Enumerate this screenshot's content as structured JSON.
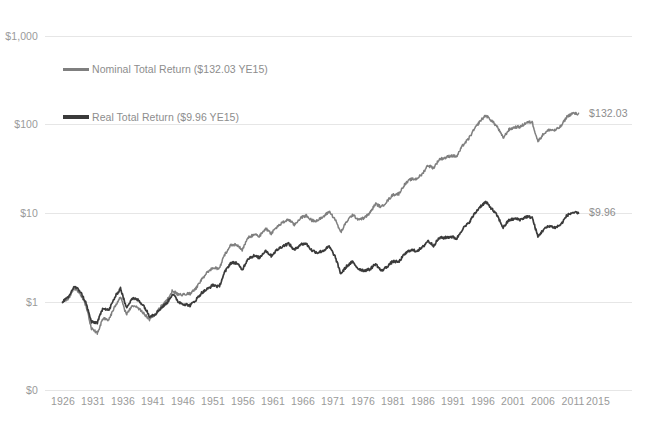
{
  "chart_data": {
    "type": "line",
    "title": "",
    "subtitle": "",
    "xlabel": "",
    "ylabel": "",
    "yscale": "log",
    "grid": true,
    "legend_position": "upper-left-inside",
    "y_ticks": [
      "$0",
      "$1",
      "$10",
      "$100",
      "$1,000"
    ],
    "y_tick_values": [
      0,
      1,
      10,
      100,
      1000
    ],
    "ylim": [
      0,
      1000
    ],
    "x_ticks": [
      "1926",
      "1931",
      "1936",
      "1941",
      "1946",
      "1951",
      "1956",
      "1961",
      "1966",
      "1971",
      "1976",
      "1981",
      "1986",
      "1991",
      "1996",
      "2001",
      "2006",
      "2011",
      "2015"
    ],
    "x_tick_values": [
      1926,
      1931,
      1936,
      1941,
      1946,
      1951,
      1956,
      1961,
      1966,
      1971,
      1976,
      1981,
      1986,
      1991,
      1996,
      2001,
      2006,
      2011,
      2015
    ],
    "xlim": [
      1926,
      2015
    ],
    "series": [
      {
        "name": "Nominal Total Return ($132.03 YE15)",
        "short_name": "Nominal Total Return",
        "color": "#7f7f7f",
        "end_label": "$132.03",
        "end_value": 132.03,
        "x": [
          1926,
          1927,
          1928,
          1929,
          1930,
          1931,
          1932,
          1933,
          1934,
          1935,
          1936,
          1937,
          1938,
          1939,
          1940,
          1941,
          1942,
          1943,
          1944,
          1945,
          1946,
          1947,
          1948,
          1949,
          1950,
          1951,
          1952,
          1953,
          1954,
          1955,
          1956,
          1957,
          1958,
          1959,
          1960,
          1961,
          1962,
          1963,
          1964,
          1965,
          1966,
          1967,
          1968,
          1969,
          1970,
          1971,
          1972,
          1973,
          1974,
          1975,
          1976,
          1977,
          1978,
          1979,
          1980,
          1981,
          1982,
          1983,
          1984,
          1985,
          1986,
          1987,
          1988,
          1989,
          1990,
          1991,
          1992,
          1993,
          1994,
          1995,
          1996,
          1997,
          1998,
          1999,
          2000,
          2001,
          2002,
          2003,
          2004,
          2005,
          2006,
          2007,
          2008,
          2009,
          2010,
          2011,
          2012,
          2013,
          2014,
          2015
        ],
        "values": [
          1.0,
          1.12,
          1.55,
          1.43,
          1.08,
          0.61,
          0.56,
          0.86,
          0.85,
          1.25,
          1.68,
          1.09,
          1.42,
          1.41,
          1.27,
          1.12,
          1.35,
          1.7,
          2.04,
          2.78,
          2.56,
          2.71,
          2.86,
          3.39,
          4.46,
          5.53,
          6.55,
          6.49,
          9.9,
          13.03,
          13.88,
          12.38,
          17.75,
          19.87,
          19.97,
          25.34,
          23.13,
          28.39,
          33.08,
          37.21,
          33.48,
          41.48,
          46.06,
          42.13,
          43.79,
          50.03,
          59.52,
          50.79,
          37.33,
          51.23,
          63.46,
          58.93,
          62.78,
          74.4,
          98.53,
          93.67,
          113.82,
          139.47,
          148.28,
          195.37,
          231.71,
          243.86,
          284.24,
          374.22,
          362.56,
          472.94,
          508.93,
          559.97,
          567.37,
          780.35,
          959.63,
          1279.86,
          1645.51,
          1991.07,
          1809.71,
          1594.92,
          1242.57,
          1599.14,
          1773.09,
          1860.17,
          2154.1,
          2272.09,
          1431.42,
          1810.95,
          2084.22,
          2128.71,
          2469.3,
          3268.69,
          3716.94,
          3768.42
        ],
        "note": "annual cumulative growth of $1 invested at YE1925, nominal terms"
      },
      {
        "name": "Real Total Return ($9.96 YE15)",
        "short_name": "Real Total Return",
        "color": "#3a3a3a",
        "end_label": "$9.96",
        "end_value": 9.96,
        "x": [
          1926,
          1927,
          1928,
          1929,
          1930,
          1931,
          1932,
          1933,
          1934,
          1935,
          1936,
          1937,
          1938,
          1939,
          1940,
          1941,
          1942,
          1943,
          1944,
          1945,
          1946,
          1947,
          1948,
          1949,
          1950,
          1951,
          1952,
          1953,
          1954,
          1955,
          1956,
          1957,
          1958,
          1959,
          1960,
          1961,
          1962,
          1963,
          1964,
          1965,
          1966,
          1967,
          1968,
          1969,
          1970,
          1971,
          1972,
          1973,
          1974,
          1975,
          1976,
          1977,
          1978,
          1979,
          1980,
          1981,
          1982,
          1983,
          1984,
          1985,
          1986,
          1987,
          1988,
          1989,
          1990,
          1991,
          1992,
          1993,
          1994,
          1995,
          1996,
          1997,
          1998,
          1999,
          2000,
          2001,
          2002,
          2003,
          2004,
          2005,
          2006,
          2007,
          2008,
          2009,
          2010,
          2011,
          2012,
          2013,
          2014,
          2015
        ],
        "values": [
          1.02,
          1.16,
          1.62,
          1.5,
          1.16,
          0.72,
          0.74,
          1.13,
          1.1,
          1.58,
          2.1,
          1.32,
          1.75,
          1.74,
          1.56,
          1.24,
          1.35,
          1.65,
          1.94,
          2.57,
          2.16,
          2.12,
          2.13,
          2.55,
          3.19,
          3.66,
          4.24,
          4.17,
          6.39,
          8.37,
          8.77,
          7.58,
          10.58,
          11.74,
          11.62,
          14.6,
          13.2,
          16.0,
          18.37,
          20.33,
          17.8,
          21.44,
          22.85,
          19.85,
          19.48,
          21.34,
          24.63,
          19.85,
          13.14,
          16.55,
          19.34,
          16.87,
          16.64,
          17.88,
          21.44,
          18.51,
          21.63,
          25.65,
          26.14,
          33.28,
          38.71,
          39.09,
          43.74,
          54.99,
          50.5,
          63.96,
          66.8,
          71.4,
          70.49,
          94.3,
          112.55,
          147.68,
          186.99,
          220.39,
          193.73,
          166.22,
          127.43,
          160.41,
          173.11,
          175.72,
          197.09,
          201.5,
          126.63,
          159.81,
          181.22,
          179.54,
          204.03,
          266.85,
          298.64,
          302.43
        ],
        "note": "annual cumulative growth of $1 invested at YE1925, inflation-adjusted"
      }
    ]
  },
  "axis": {
    "y_labels": [
      {
        "text": "$1,000",
        "value": 1000
      },
      {
        "text": "$100",
        "value": 100
      },
      {
        "text": "$10",
        "value": 10
      },
      {
        "text": "$1",
        "value": 1
      },
      {
        "text": "$0",
        "value": 0
      }
    ],
    "x_labels": [
      "1926",
      "1931",
      "1936",
      "1941",
      "1946",
      "1951",
      "1956",
      "1961",
      "1966",
      "1971",
      "1976",
      "1981",
      "1986",
      "1991",
      "1996",
      "2001",
      "2006",
      "2011",
      "2015"
    ]
  },
  "legend": {
    "items": [
      {
        "label": "Nominal Total Return ($132.03 YE15)",
        "color": "#7f7f7f"
      },
      {
        "label": "Real Total Return ($9.96 YE15)",
        "color": "#3a3a3a"
      }
    ]
  },
  "end_labels": [
    {
      "text": "$132.03",
      "color": "#8d8d8d"
    },
    {
      "text": "$9.96",
      "color": "#8d8d8d"
    }
  ],
  "colors": {
    "background": "#ffffff",
    "gridline": "#e6e6e6",
    "nominal_line": "#7f7f7f",
    "real_line": "#3a3a3a",
    "tick_text": "#9a9a9a"
  }
}
